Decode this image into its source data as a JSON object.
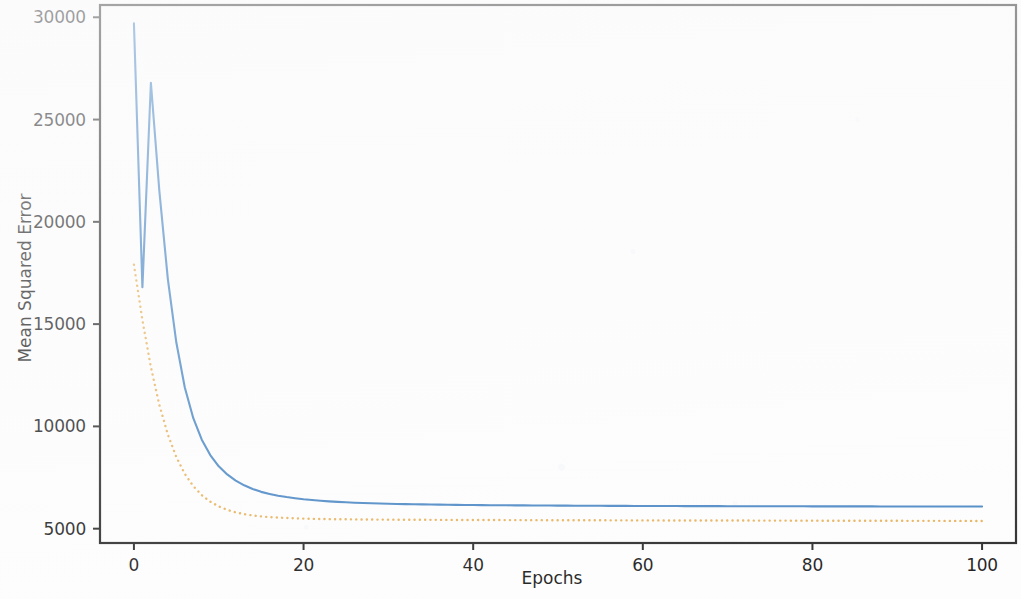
{
  "chart_data": {
    "type": "line",
    "title": "",
    "xlabel": "Epochs",
    "ylabel": "Mean Squared Error",
    "xlim": [
      -4,
      104
    ],
    "ylim": [
      4300,
      30600
    ],
    "xticks": [
      0,
      20,
      40,
      60,
      80,
      100
    ],
    "xtick_labels": [
      "0",
      "20",
      "40",
      "60",
      "80",
      "100"
    ],
    "yticks": [
      5000,
      10000,
      15000,
      20000,
      25000,
      30000
    ],
    "ytick_labels": [
      "5000",
      "10000",
      "15000",
      "20000",
      "25000",
      "30000"
    ],
    "grid": false,
    "legend": null,
    "colors": {
      "training": "#4a87c4",
      "validation": "#e8b25c",
      "axis": "#2b2b2b",
      "text": "#1d1d1d",
      "background": "#fdfdfd"
    },
    "x": [
      0,
      1,
      2,
      3,
      4,
      5,
      6,
      7,
      8,
      9,
      10,
      11,
      12,
      13,
      14,
      15,
      16,
      17,
      18,
      19,
      20,
      21,
      22,
      23,
      24,
      25,
      26,
      27,
      28,
      29,
      30,
      31,
      32,
      33,
      34,
      35,
      36,
      37,
      38,
      39,
      40,
      41,
      42,
      43,
      44,
      45,
      46,
      47,
      48,
      49,
      50,
      51,
      52,
      53,
      54,
      55,
      56,
      57,
      58,
      59,
      60,
      61,
      62,
      63,
      64,
      65,
      66,
      67,
      68,
      69,
      70,
      71,
      72,
      73,
      74,
      75,
      76,
      77,
      78,
      79,
      80,
      81,
      82,
      83,
      84,
      85,
      86,
      87,
      88,
      89,
      90,
      91,
      92,
      93,
      94,
      95,
      96,
      97,
      98,
      99,
      100
    ],
    "series": [
      {
        "name": "training",
        "style": "solid",
        "color": "#4a87c4",
        "linewidth": 2.1,
        "values": [
          29700,
          16800,
          26800,
          21500,
          17200,
          14100,
          11900,
          10400,
          9350,
          8600,
          8050,
          7650,
          7350,
          7120,
          6940,
          6800,
          6700,
          6610,
          6545,
          6490,
          6440,
          6400,
          6365,
          6335,
          6310,
          6290,
          6270,
          6255,
          6240,
          6230,
          6218,
          6210,
          6200,
          6192,
          6186,
          6180,
          6174,
          6168,
          6164,
          6160,
          6156,
          6152,
          6148,
          6146,
          6142,
          6140,
          6137,
          6134,
          6132,
          6130,
          6128,
          6126,
          6124,
          6122,
          6120,
          6118,
          6117,
          6115,
          6114,
          6112,
          6111,
          6110,
          6108,
          6107,
          6106,
          6105,
          6104,
          6103,
          6102,
          6101,
          6100,
          6099,
          6098,
          6097,
          6096,
          6096,
          6095,
          6094,
          6093,
          6093,
          6092,
          6091,
          6091,
          6090,
          6090,
          6089,
          6088,
          6088,
          6087,
          6087,
          6086,
          6086,
          6085,
          6085,
          6084,
          6084,
          6083,
          6083,
          6082,
          6082,
          6081
        ]
      },
      {
        "name": "validation",
        "style": "dotted",
        "color": "#e8b25c",
        "linewidth": 2.4,
        "values": [
          17900,
          15200,
          12900,
          11050,
          9600,
          8500,
          7680,
          7080,
          6640,
          6320,
          6090,
          5920,
          5800,
          5710,
          5645,
          5600,
          5565,
          5540,
          5520,
          5505,
          5492,
          5482,
          5474,
          5468,
          5462,
          5458,
          5454,
          5450,
          5447,
          5444,
          5442,
          5440,
          5438,
          5436,
          5434,
          5432,
          5430,
          5429,
          5427,
          5426,
          5425,
          5423,
          5422,
          5421,
          5420,
          5419,
          5418,
          5417,
          5416,
          5415,
          5414,
          5413,
          5412,
          5411,
          5410,
          5409,
          5408,
          5408,
          5407,
          5406,
          5405,
          5405,
          5404,
          5403,
          5402,
          5402,
          5401,
          5400,
          5400,
          5399,
          5398,
          5398,
          5397,
          5396,
          5396,
          5395,
          5394,
          5394,
          5393,
          5392,
          5392,
          5391,
          5390,
          5390,
          5389,
          5388,
          5388,
          5387,
          5386,
          5386,
          5385,
          5384,
          5384,
          5383,
          5382,
          5382,
          5381,
          5380,
          5380,
          5379,
          5378
        ]
      }
    ]
  }
}
